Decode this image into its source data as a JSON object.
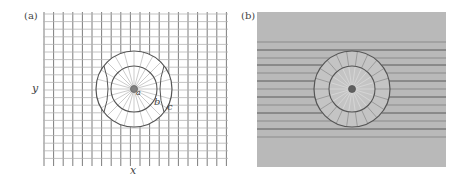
{
  "figure": {
    "panels": [
      {
        "id": "a",
        "label": "(a)",
        "axis_x_label": "x",
        "axis_y_label": "y",
        "region_labels": {
          "a": "a",
          "b": "b",
          "c": "c"
        },
        "description": "Uniform Cartesian grid with concentric circular cloak (inner radius a, outer radius b/c) where grid lines are radially compressed into the annulus"
      },
      {
        "id": "b",
        "label": "(b)",
        "description": "Horizontal field/ray lines on gray background bending around a concentric circular cloak region"
      }
    ],
    "colors": {
      "grid_dark": "#6e6e6e",
      "grid_light": "#b4b4b4",
      "circle": "#555555",
      "panel_b_bg": "#b9b9b9",
      "core": "#808080"
    }
  }
}
